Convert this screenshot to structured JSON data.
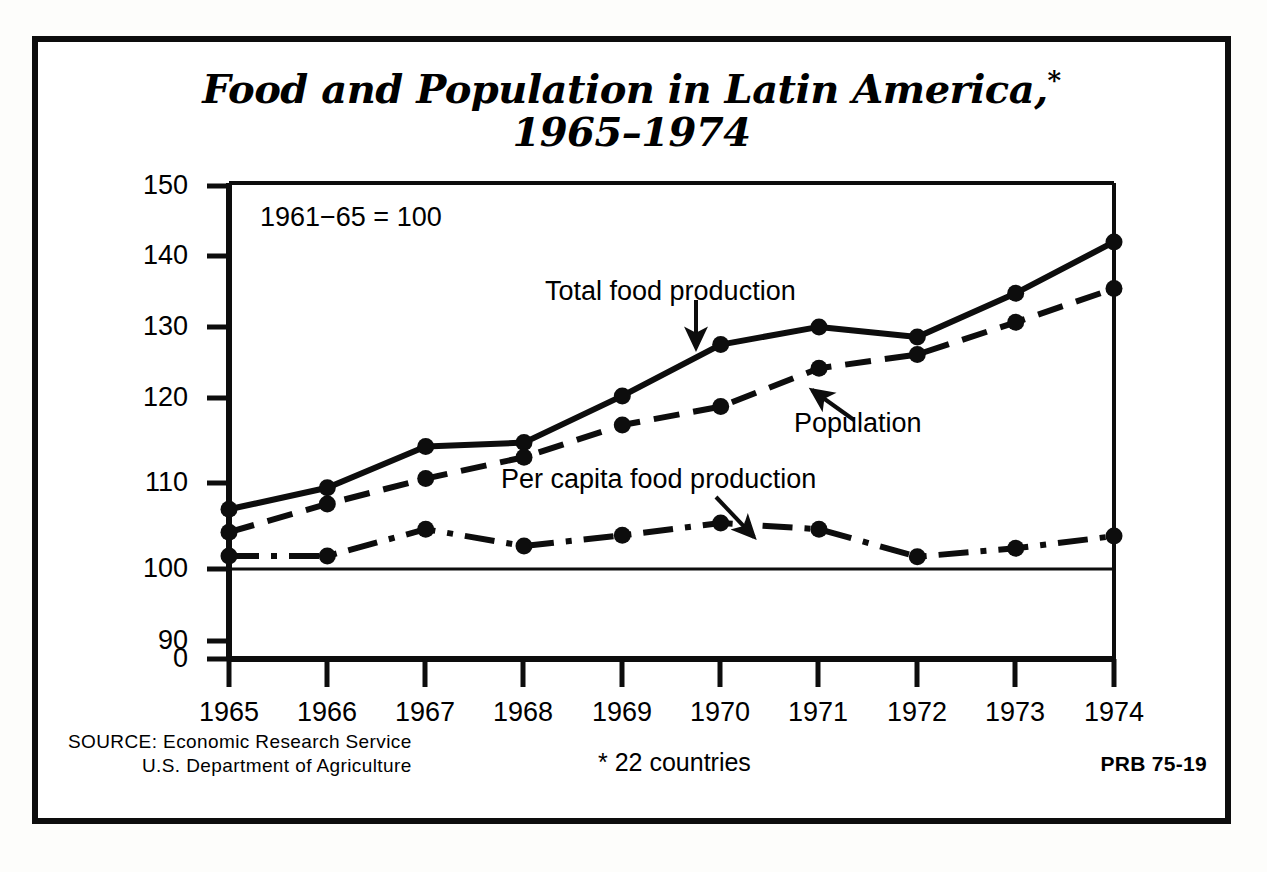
{
  "title": {
    "line1": "Food and Population in Latin America,",
    "star": "*",
    "line2": "1965–1974"
  },
  "plot_note": "1961−65 = 100",
  "footer": {
    "source_lead": "SOURCE:",
    "source_line1": " Economic Research Service",
    "source_line2": "U.S. Department of Agriculture",
    "note": "* 22 countries",
    "code": "PRB 75-19"
  },
  "chart_data": {
    "type": "line",
    "title": "Food and Population in Latin America,* 1965–1974",
    "subtitle": "1961−65 = 100",
    "xlabel": "",
    "ylabel": "",
    "index_base": "1961−65 = 100",
    "grid": false,
    "legend": "inline annotations with arrows",
    "x": [
      1965,
      1966,
      1967,
      1968,
      1969,
      1970,
      1971,
      1972,
      1973,
      1974
    ],
    "xtick_labels": [
      "1965",
      "1966",
      "1967",
      "1968",
      "1969",
      "1970",
      "1971",
      "1972",
      "1973",
      "1974"
    ],
    "ytick_labels": [
      "0",
      "90",
      "100",
      "110",
      "120",
      "130",
      "140",
      "150"
    ],
    "ytick_values": [
      0,
      90,
      100,
      110,
      120,
      130,
      140,
      150
    ],
    "ylim": [
      88,
      150
    ],
    "y_axis_break": true,
    "reference_line": 100,
    "series": [
      {
        "name": "Total food production",
        "style": "solid",
        "values": [
          107.8,
          110.6,
          116.0,
          116.5,
          122.6,
          129.3,
          131.6,
          130.3,
          136.0,
          142.7
        ]
      },
      {
        "name": "Population",
        "style": "dashed",
        "values": [
          104.8,
          108.5,
          111.8,
          114.6,
          118.8,
          121.2,
          126.2,
          128.0,
          132.2,
          136.6
        ]
      },
      {
        "name": "Per capita food production",
        "style": "dash-dot",
        "values": [
          101.7,
          101.7,
          105.2,
          103.0,
          104.4,
          106.0,
          105.2,
          101.6,
          102.7,
          104.3
        ]
      }
    ],
    "annotations": [
      {
        "text": "Total food production",
        "points_to_series": "Total food production",
        "arrow": "down"
      },
      {
        "text": "Population",
        "points_to_series": "Population",
        "arrow": "up-left"
      },
      {
        "text": "Per capita food production",
        "points_to_series": "Per capita food production",
        "arrow": "down-right"
      }
    ],
    "colors": {
      "line": "#0d0d0d",
      "background": "#ffffff"
    }
  }
}
